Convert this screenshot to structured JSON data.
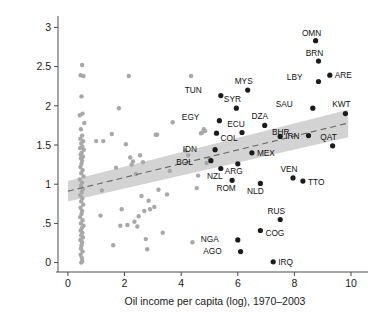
{
  "chart_data": {
    "type": "scatter",
    "title": "",
    "xlabel": "Oil income per capita (log), 1970–2003",
    "ylabel": "Drop in child mortality (log), 1970–2003",
    "xlim": [
      -0.35,
      10.6
    ],
    "ylim": [
      -0.12,
      3.12
    ],
    "xticks": [
      0,
      2,
      4,
      6,
      8,
      10
    ],
    "xtick_labels": [
      "0",
      "2",
      "4",
      "6",
      "8",
      "10"
    ],
    "yticks": [
      0,
      0.5,
      1,
      1.5,
      2,
      2.5,
      3
    ],
    "ytick_labels": [
      "0",
      ".5",
      "1",
      "1.5",
      "2",
      "2.5",
      "3"
    ],
    "grid": false,
    "legend": "none",
    "colors": {
      "highlight_point": "#1c1c1c",
      "background_point": "#a8a8a8",
      "confidence_band": "#d3d3d3",
      "fit_line": "#666666",
      "axis": "#4a4a4a",
      "text": "#1a1a1a"
    },
    "fit_line": {
      "style": "dashed",
      "description": "Linear fit with shaded 95% confidence band",
      "x_start": 0.0,
      "y_start": 0.91,
      "x_end": 9.9,
      "y_end": 1.78
    },
    "confidence_band": {
      "x_start": 0.0,
      "x_end": 9.9,
      "lower_start": 0.78,
      "upper_start": 1.04,
      "lower_end": 1.6,
      "upper_end": 1.95
    },
    "labeled_series": {
      "name": "Oil exporting countries",
      "points": [
        {
          "label": "OMN",
          "x": 8.75,
          "y": 2.83,
          "label_dx": -4,
          "label_dy": -5
        },
        {
          "label": "BRN",
          "x": 8.85,
          "y": 2.57,
          "label_dx": -4,
          "label_dy": -5
        },
        {
          "label": "LBY",
          "x": 8.85,
          "y": 2.31,
          "label_dx": -16,
          "label_dy": -2
        },
        {
          "label": "ARE",
          "x": 9.25,
          "y": 2.39,
          "label_dx": 5,
          "label_dy": 3
        },
        {
          "label": "MYS",
          "x": 6.35,
          "y": 2.2,
          "label_dx": -4,
          "label_dy": -6
        },
        {
          "label": "TUN",
          "x": 5.4,
          "y": 2.13,
          "label_dx": -19,
          "label_dy": -3
        },
        {
          "label": "SYR",
          "x": 5.95,
          "y": 1.97,
          "label_dx": -4,
          "label_dy": -6
        },
        {
          "label": "SAU",
          "x": 8.65,
          "y": 1.97,
          "label_dx": -20,
          "label_dy": -1
        },
        {
          "label": "KWT",
          "x": 9.8,
          "y": 1.9,
          "label_dx": -4,
          "label_dy": -7
        },
        {
          "label": "EGY",
          "x": 5.35,
          "y": 1.81,
          "label_dx": -20,
          "label_dy": -1
        },
        {
          "label": "DZA",
          "x": 6.95,
          "y": 1.75,
          "label_dx": -5,
          "label_dy": -6
        },
        {
          "label": "ECU",
          "x": 6.15,
          "y": 1.66,
          "label_dx": -6,
          "label_dy": -6
        },
        {
          "label": "COL",
          "x": 5.25,
          "y": 1.65,
          "label_dx": 4,
          "label_dy": 8
        },
        {
          "label": "IRN",
          "x": 7.5,
          "y": 1.61,
          "label_dx": 5,
          "label_dy": 3
        },
        {
          "label": "BHR",
          "x": 8.5,
          "y": 1.62,
          "label_dx": -19,
          "label_dy": -1
        },
        {
          "label": "QAT",
          "x": 9.35,
          "y": 1.49,
          "label_dx": -4,
          "label_dy": -6
        },
        {
          "label": "IDN",
          "x": 5.2,
          "y": 1.44,
          "label_dx": -18,
          "label_dy": 2
        },
        {
          "label": "MEX",
          "x": 6.5,
          "y": 1.4,
          "label_dx": 5,
          "label_dy": 3
        },
        {
          "label": "BOL",
          "x": 5.05,
          "y": 1.3,
          "label_dx": -18,
          "label_dy": 4
        },
        {
          "label": "ARG",
          "x": 6.0,
          "y": 1.26,
          "label_dx": -4,
          "label_dy": 10
        },
        {
          "label": "NZL",
          "x": 5.4,
          "y": 1.2,
          "label_dx": -6,
          "label_dy": 10
        },
        {
          "label": "VEN",
          "x": 7.95,
          "y": 1.08,
          "label_dx": -4,
          "label_dy": -6
        },
        {
          "label": "TTO",
          "x": 8.3,
          "y": 1.04,
          "label_dx": 5,
          "label_dy": 4
        },
        {
          "label": "ROM",
          "x": 5.8,
          "y": 1.05,
          "label_dx": -6,
          "label_dy": 11
        },
        {
          "label": "NLD",
          "x": 6.8,
          "y": 1.01,
          "label_dx": -5,
          "label_dy": 11
        },
        {
          "label": "RUS",
          "x": 7.5,
          "y": 0.55,
          "label_dx": -4,
          "label_dy": -6
        },
        {
          "label": "COG",
          "x": 6.8,
          "y": 0.41,
          "label_dx": 5,
          "label_dy": 5
        },
        {
          "label": "NGA",
          "x": 6.0,
          "y": 0.29,
          "label_dx": -19,
          "label_dy": 2
        },
        {
          "label": "AGO",
          "x": 6.1,
          "y": 0.14,
          "label_dx": -19,
          "label_dy": 2
        },
        {
          "label": "IRQ",
          "x": 7.25,
          "y": 0.01,
          "label_dx": 5,
          "label_dy": 3
        }
      ]
    },
    "background_series": {
      "name": "Other countries",
      "x": [
        0.5,
        0.45,
        0.55,
        0.48,
        0.52,
        0.42,
        0.58,
        0.46,
        0.5,
        0.44,
        0.54,
        0.47,
        0.51,
        0.43,
        0.56,
        0.49,
        0.45,
        0.53,
        0.46,
        0.5,
        0.48,
        0.44,
        0.52,
        0.47,
        0.55,
        0.42,
        0.5,
        0.46,
        0.53,
        0.49,
        0.44,
        0.51,
        0.47,
        0.54,
        0.45,
        0.5,
        0.48,
        0.43,
        0.52,
        0.46,
        0.55,
        0.49,
        0.45,
        0.51,
        0.47,
        0.53,
        0.44,
        0.5,
        0.48,
        0.46,
        0.52,
        0.45,
        0.49,
        0.51,
        0.47,
        1.0,
        1.2,
        1.15,
        1.55,
        1.6,
        1.8,
        1.85,
        2.05,
        2.15,
        2.2,
        2.25,
        2.3,
        2.45,
        2.55,
        2.6,
        2.65,
        2.7,
        2.75,
        2.8,
        3.1,
        3.15,
        3.2,
        3.35,
        3.6,
        3.7,
        4.15,
        4.25,
        4.35,
        4.4,
        4.7,
        4.75,
        4.8,
        4.85,
        2.1,
        2.35,
        2.5,
        1.9,
        1.25,
        2.9,
        3.05,
        4.55,
        4.6,
        4.9,
        5.0,
        2.4,
        2.85,
        1.7,
        3.5
      ],
      "y": [
        2.52,
        2.39,
        2.38,
        2.12,
        1.9,
        1.88,
        1.78,
        1.7,
        1.62,
        1.58,
        1.55,
        1.52,
        1.48,
        1.46,
        1.44,
        1.4,
        1.38,
        1.35,
        1.33,
        1.3,
        1.26,
        1.22,
        1.18,
        1.14,
        1.1,
        1.06,
        1.02,
        0.98,
        0.94,
        0.9,
        0.86,
        0.82,
        0.78,
        0.74,
        0.7,
        0.66,
        0.62,
        0.58,
        0.54,
        0.5,
        0.47,
        0.44,
        0.41,
        0.38,
        0.35,
        0.32,
        0.29,
        0.26,
        0.22,
        0.18,
        0.14,
        0.1,
        0.06,
        0.02,
        0.0,
        1.55,
        0.92,
        0.6,
        1.64,
        0.22,
        1.97,
        0.47,
        1.51,
        2.38,
        1.34,
        1.25,
        1.29,
        0.46,
        1.37,
        0.85,
        1.28,
        0.66,
        0.3,
        0.17,
        1.63,
        1.63,
        0.93,
        0.38,
        1.17,
        1.79,
        1.43,
        1.37,
        2.38,
        0.26,
        1.65,
        1.66,
        1.7,
        1.68,
        0.48,
        0.52,
        0.59,
        0.68,
        1.55,
        0.68,
        0.71,
        0.95,
        1.11,
        1.27,
        1.33,
        1.13,
        0.79,
        1.21,
        0.87
      ]
    }
  }
}
